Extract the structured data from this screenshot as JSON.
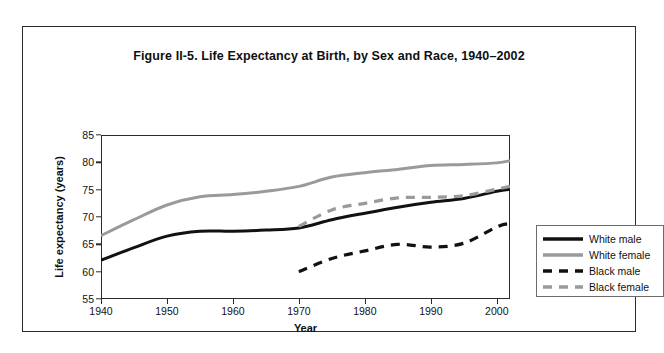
{
  "figure": {
    "title": "Figure II-5. Life Expectancy at Birth, by Sex and Race, 1940–2002"
  },
  "colors": {
    "black_series": "#111111",
    "gray_series": "#9a9a9a",
    "axis": "#2b2b2b",
    "frame": "#2b2b2b",
    "background": "#ffffff"
  },
  "legend": {
    "position": "right",
    "entries": [
      {
        "label": "White male",
        "color": "#111111",
        "style": "solid"
      },
      {
        "label": "White female",
        "color": "#9a9a9a",
        "style": "solid"
      },
      {
        "label": "Black male",
        "color": "#111111",
        "style": "dashed"
      },
      {
        "label": "Black female",
        "color": "#9a9a9a",
        "style": "dashed"
      }
    ]
  },
  "chart_data": {
    "type": "line",
    "title": "Figure II-5. Life Expectancy at Birth, by Sex and Race, 1940–2002",
    "xlabel": "Year",
    "ylabel": "Life expectancy (years)",
    "xlim": [
      1940,
      2002
    ],
    "ylim": [
      55,
      85
    ],
    "xticks": [
      1940,
      1950,
      1960,
      1970,
      1980,
      1990,
      2000
    ],
    "yticks": [
      55,
      60,
      65,
      70,
      75,
      80,
      85
    ],
    "grid": false,
    "legend_position": "right",
    "series": [
      {
        "name": "White male",
        "color": "#111111",
        "style": "solid",
        "x": [
          1940,
          1945,
          1950,
          1955,
          1960,
          1965,
          1970,
          1975,
          1980,
          1985,
          1990,
          1995,
          2000,
          2002
        ],
        "values": [
          62.1,
          64.4,
          66.5,
          67.4,
          67.4,
          67.6,
          68.0,
          69.5,
          70.7,
          71.8,
          72.7,
          73.4,
          74.7,
          75.1
        ]
      },
      {
        "name": "White female",
        "color": "#9a9a9a",
        "style": "solid",
        "x": [
          1940,
          1945,
          1950,
          1955,
          1960,
          1965,
          1970,
          1975,
          1980,
          1985,
          1990,
          1995,
          2000,
          2002
        ],
        "values": [
          66.6,
          69.5,
          72.2,
          73.7,
          74.1,
          74.7,
          75.6,
          77.3,
          78.1,
          78.7,
          79.4,
          79.6,
          79.9,
          80.3
        ]
      },
      {
        "name": "Black male",
        "color": "#111111",
        "style": "dashed",
        "x": [
          1970,
          1975,
          1980,
          1985,
          1990,
          1995,
          2000,
          2002
        ],
        "values": [
          60.0,
          62.4,
          63.8,
          65.0,
          64.5,
          65.2,
          68.2,
          68.8
        ]
      },
      {
        "name": "Black female",
        "color": "#9a9a9a",
        "style": "dashed",
        "x": [
          1970,
          1975,
          1980,
          1985,
          1990,
          1995,
          2000,
          2002
        ],
        "values": [
          68.3,
          71.3,
          72.5,
          73.5,
          73.6,
          73.9,
          75.1,
          75.6
        ]
      }
    ]
  }
}
